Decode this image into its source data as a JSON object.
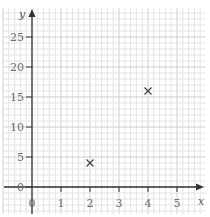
{
  "chart_data": {
    "type": "scatter",
    "title": "",
    "xlabel": "x",
    "ylabel": "y",
    "xlim": [
      0,
      5.5
    ],
    "ylim": [
      0,
      28
    ],
    "x_ticks": [
      0,
      1,
      2,
      3,
      4,
      5
    ],
    "y_ticks": [
      0,
      5,
      10,
      15,
      20,
      25
    ],
    "grid": true,
    "legend": null,
    "marker": "x",
    "series": [
      {
        "name": "points",
        "points": [
          {
            "x": 2,
            "y": 4
          },
          {
            "x": 4,
            "y": 16
          }
        ]
      }
    ]
  },
  "layout": {
    "origin_px": {
      "x": 32,
      "y": 187
    },
    "px_per_x_unit": 29,
    "px_per_y_unit": 6,
    "colors": {
      "grid_minor": "#e4e4e4",
      "grid_major": "#cfcfcf",
      "axis": "#333333",
      "marker": "#444444",
      "tick_text": "#6b6b6b"
    }
  }
}
